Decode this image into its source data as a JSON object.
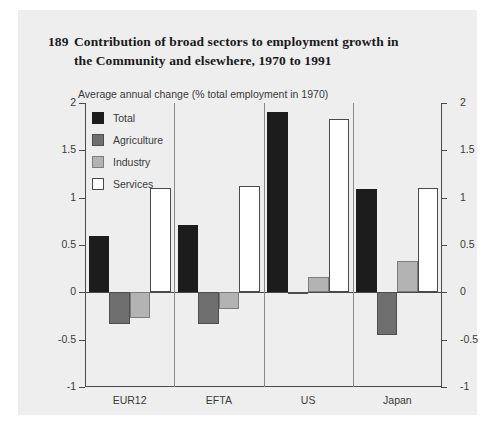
{
  "figure": {
    "number": "189",
    "title_line1": "Contribution of broad sectors to employment growth in",
    "title_line2": "the Community and elsewhere, 1970 to 1991",
    "subtitle": "Average annual change (% total employment in 1970)",
    "panel_background": "#eeeeee"
  },
  "legend": {
    "position": "top-left-inside",
    "items": [
      {
        "label": "Total",
        "color": "#1c1c1c",
        "icon": "square-swatch-icon"
      },
      {
        "label": "Agriculture",
        "color": "#6f6f6f",
        "icon": "square-swatch-icon"
      },
      {
        "label": "Industry",
        "color": "#b3b3b3",
        "icon": "square-swatch-icon"
      },
      {
        "label": "Services",
        "color": "#ffffff",
        "icon": "square-swatch-icon"
      }
    ]
  },
  "chart_data": {
    "type": "bar",
    "title": "Contribution of broad sectors to employment growth in the Community and elsewhere, 1970 to 1991",
    "subtitle": "Average annual change (% total employment in 1970)",
    "xlabel": "",
    "ylabel": "",
    "ylim": [
      -1,
      2
    ],
    "yticks": [
      -1,
      -0.5,
      0,
      0.5,
      1,
      1.5,
      2
    ],
    "ytick_labels": [
      "-1",
      "-0.5",
      "0",
      "0.5",
      "1",
      "1.5",
      "2"
    ],
    "grid": false,
    "dual_axis": true,
    "zero_line": true,
    "categories": [
      "EUR12",
      "EFTA",
      "US",
      "Japan"
    ],
    "series": [
      {
        "name": "Total",
        "color": "#1c1c1c",
        "values": [
          0.6,
          0.71,
          1.9,
          1.09
        ]
      },
      {
        "name": "Agriculture",
        "color": "#6f6f6f",
        "values": [
          -0.33,
          -0.33,
          -0.02,
          -0.45
        ]
      },
      {
        "name": "Industry",
        "color": "#b3b3b3",
        "values": [
          -0.27,
          -0.18,
          0.16,
          0.33
        ]
      },
      {
        "name": "Services",
        "color": "#ffffff",
        "values": [
          1.1,
          1.12,
          1.83,
          1.1
        ]
      }
    ]
  }
}
